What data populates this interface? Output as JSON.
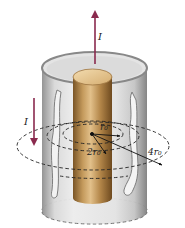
{
  "diagram": {
    "labels": {
      "current_up": "I",
      "current_down": "I",
      "radius_r0": "r₀",
      "radius_2r0": "2r₀",
      "radius_4r0": "4r₀"
    },
    "colors": {
      "arrow": "#8a2a4e",
      "rod_light": "#d9b27a",
      "rod_dark": "#8a6430",
      "shell_light": "#e6e6e6",
      "shell_dark": "#9a9a9a",
      "dashed": "#333333"
    }
  }
}
